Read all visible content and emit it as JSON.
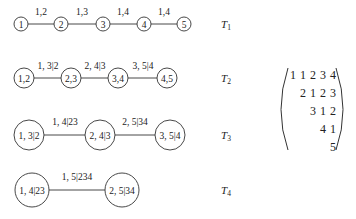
{
  "trees": [
    {
      "label": "T",
      "sub": "1",
      "nodes": [
        "1",
        "2",
        "3",
        "4",
        "5"
      ],
      "edges": [
        "1,2",
        "1,3",
        "1,4",
        "1,4"
      ]
    },
    {
      "label": "T",
      "sub": "2",
      "nodes": [
        "1,2",
        "2,3",
        "3,4",
        "4,5"
      ],
      "edges": [
        "1, 3|2",
        "2, 4|3",
        "3, 5|4"
      ]
    },
    {
      "label": "T",
      "sub": "3",
      "nodes": [
        "1, 3|2",
        "2, 4|3",
        "3, 5|4"
      ],
      "edges": [
        "1, 4|23",
        "2, 5|34"
      ]
    },
    {
      "label": "T",
      "sub": "4",
      "nodes": [
        "1, 4|23",
        "2, 5|34"
      ],
      "edges": [
        "1, 5|234"
      ]
    }
  ],
  "matrix": {
    "rows": [
      [
        "1",
        "1",
        "2",
        "3",
        "4"
      ],
      [
        "",
        "2",
        "1",
        "2",
        "3"
      ],
      [
        "",
        "",
        "3",
        "1",
        "2"
      ],
      [
        "",
        "",
        "",
        "4",
        "1"
      ],
      [
        "",
        "",
        "",
        "",
        "5"
      ]
    ]
  }
}
